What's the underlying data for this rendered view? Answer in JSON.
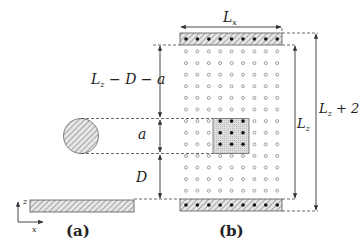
{
  "panels": [
    {
      "id": "a",
      "caption": "(a)"
    },
    {
      "id": "b",
      "caption": "(b)"
    }
  ],
  "labels": {
    "Lx": {
      "main": "L",
      "sub": "x"
    },
    "Lz_minus_D_minus_a": {
      "main": "L",
      "sub": "z",
      "rest": " − D − a"
    },
    "a": "a",
    "D": "D",
    "Lz": {
      "main": "L",
      "sub": "z"
    },
    "Lz_plus_2": {
      "main": "L",
      "sub": "z",
      "rest": " + 2"
    },
    "axis_z": "z",
    "axis_x": "x"
  },
  "grid": {
    "rows": 13,
    "cols": 9,
    "highlight_rows": [
      6,
      7,
      8
    ],
    "highlight_cols": [
      3,
      4,
      5
    ]
  },
  "colors": {
    "line": "#333333",
    "hatch_fill": "#cfcfcf",
    "box_fill": "#d4d4d4",
    "dot": "#111111",
    "open_circle": "#777777"
  }
}
